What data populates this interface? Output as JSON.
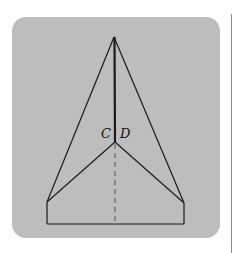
{
  "diagram": {
    "labels": {
      "c": "C",
      "d": "D"
    },
    "colors": {
      "panel": "#bdbdbd",
      "stroke": "#1a1a1a",
      "rule": "#8a8a8a"
    },
    "points": {
      "apex": [
        114,
        37
      ],
      "cd_junction": [
        115,
        142
      ],
      "left_vertex": [
        47,
        202
      ],
      "right_vertex": [
        184,
        203
      ],
      "bottom_left": [
        47,
        224
      ],
      "bottom_right": [
        184,
        224
      ]
    }
  }
}
